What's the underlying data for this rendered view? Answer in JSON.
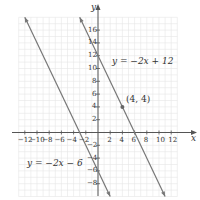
{
  "chart_data": {
    "type": "line",
    "title": "",
    "xlabel": "x",
    "ylabel": "y",
    "xlim": [
      -14,
      14
    ],
    "ylim": [
      -10,
      19
    ],
    "grid": true,
    "x_ticks": [
      -12,
      -10,
      -8,
      -6,
      -4,
      -2,
      2,
      4,
      6,
      8,
      10,
      12
    ],
    "y_ticks": [
      -8,
      -6,
      -4,
      -2,
      2,
      4,
      6,
      8,
      10,
      12,
      14,
      16
    ],
    "series": [
      {
        "name": "y = −2x + 12",
        "slope": -2,
        "intercept": 12,
        "x": [
          -3,
          11
        ],
        "y": [
          18,
          -10
        ]
      },
      {
        "name": "y = −2x − 6",
        "slope": -2,
        "intercept": -6,
        "x": [
          -12,
          2
        ],
        "y": [
          18,
          -10
        ]
      }
    ],
    "points": [
      {
        "label": "(4, 4)",
        "x": 4,
        "y": 4
      }
    ],
    "line_color": "#777777"
  },
  "labels": {
    "x_axis": "x",
    "y_axis": "y",
    "eq1": "y = −2x + 12",
    "eq2": "y = −2x − 6",
    "point": "(4, 4)",
    "x_ticks": [
      "−12",
      "−10",
      "−8",
      "−6",
      "−4",
      "−2",
      "2",
      "4",
      "6",
      "8",
      "10",
      "12"
    ],
    "y_ticks": [
      "16",
      "14",
      "12",
      "10",
      "8",
      "6",
      "4",
      "2",
      "−2",
      "−4",
      "−6",
      "−8"
    ]
  }
}
